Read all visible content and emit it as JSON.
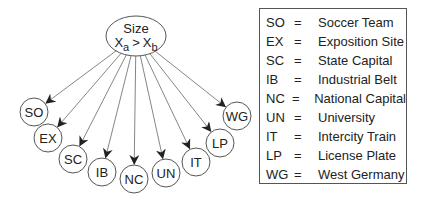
{
  "diagram": {
    "root": {
      "title": "Size",
      "relation": {
        "left_var": "X",
        "left_sub": "a",
        "op": ">",
        "right_var": "X",
        "right_sub": "b"
      },
      "cx": 136,
      "cy": 36,
      "rx": 30,
      "ry": 20
    },
    "children": [
      {
        "id": "SO",
        "cx": 34,
        "cy": 112
      },
      {
        "id": "EX",
        "cx": 48,
        "cy": 138
      },
      {
        "id": "SC",
        "cx": 73,
        "cy": 159
      },
      {
        "id": "IB",
        "cx": 102,
        "cy": 172
      },
      {
        "id": "NC",
        "cx": 134,
        "cy": 179
      },
      {
        "id": "UN",
        "cx": 166,
        "cy": 173
      },
      {
        "id": "IT",
        "cx": 196,
        "cy": 162
      },
      {
        "id": "LP",
        "cx": 220,
        "cy": 143
      },
      {
        "id": "WG",
        "cx": 237,
        "cy": 116
      }
    ],
    "node_radius": 14,
    "colors": {
      "stroke": "#555555",
      "arrow": "#222222",
      "text": "#222222"
    }
  },
  "legend": {
    "rows": [
      {
        "abbr": "SO",
        "eq": "=",
        "desc": "Soccer Team"
      },
      {
        "abbr": "EX",
        "eq": "=",
        "desc": "Exposition Site"
      },
      {
        "abbr": "SC",
        "eq": "=",
        "desc": "State Capital"
      },
      {
        "abbr": "IB",
        "eq": "=",
        "desc": "Industrial Belt"
      },
      {
        "abbr": "NC",
        "eq": "=",
        "desc": "National Capital"
      },
      {
        "abbr": "UN",
        "eq": "=",
        "desc": "University"
      },
      {
        "abbr": "IT",
        "eq": "=",
        "desc": "Intercity Train"
      },
      {
        "abbr": "LP",
        "eq": "=",
        "desc": "License Plate"
      },
      {
        "abbr": "WG",
        "eq": "=",
        "desc": "West Germany"
      }
    ]
  }
}
